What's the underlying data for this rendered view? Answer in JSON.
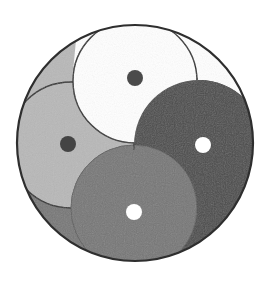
{
  "figure": {
    "outer_circle": {
      "cx": 135,
      "cy": 143,
      "r": 118,
      "stroke": "#3a3a3a"
    },
    "colors": {
      "white": "#ffffff",
      "light_gray": "#b8b8b8",
      "medium_gray": "#777777",
      "dark_gray": "#4b4b4b",
      "outline": "#2e2e2e"
    },
    "segments": [
      {
        "name": "white",
        "head": {
          "cx": 135,
          "cy": 81,
          "r": 62
        },
        "dot": {
          "cx": 135,
          "cy": 78,
          "r": 8,
          "color": "#4b4b4b"
        }
      },
      {
        "name": "dark_gray",
        "head": {
          "cx": 199,
          "cy": 145,
          "r": 65
        },
        "dot": {
          "cx": 203,
          "cy": 145,
          "r": 8,
          "color": "#ffffff"
        }
      },
      {
        "name": "medium_gray",
        "head": {
          "cx": 134,
          "cy": 208,
          "r": 63
        },
        "dot": {
          "cx": 134,
          "cy": 212,
          "r": 8,
          "color": "#ffffff"
        }
      },
      {
        "name": "light_gray",
        "head": {
          "cx": 71,
          "cy": 145,
          "r": 63
        },
        "dot": {
          "cx": 68,
          "cy": 144,
          "r": 8,
          "color": "#4b4b4b"
        }
      }
    ]
  }
}
